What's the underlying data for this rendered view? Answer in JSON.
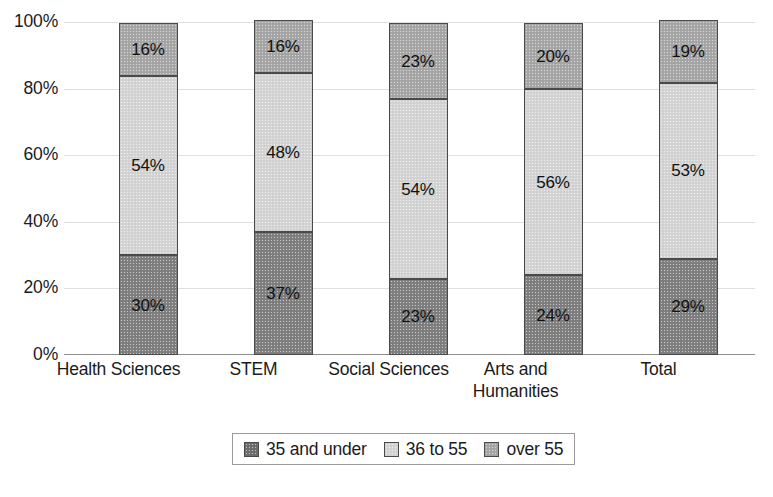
{
  "chart_data": {
    "type": "bar",
    "stacked": true,
    "normalized_percent": true,
    "title": "",
    "subtitle": "",
    "xlabel": "",
    "ylabel": "",
    "ylim": [
      0,
      100
    ],
    "ytick_labels": [
      "0%",
      "20%",
      "40%",
      "60%",
      "80%",
      "100%"
    ],
    "ytick_values": [
      0,
      20,
      40,
      60,
      80,
      100
    ],
    "grid": true,
    "legend_position": "bottom-center",
    "categories": [
      "Health Sciences",
      "STEM",
      "Social Sciences",
      "Arts and Humanities",
      "Total"
    ],
    "series": [
      {
        "name": "35 and under",
        "color": "#808080",
        "values": [
          30,
          37,
          23,
          24,
          29
        ],
        "labels": [
          "30%",
          "37%",
          "23%",
          "24%",
          "29%"
        ]
      },
      {
        "name": "36 to 55",
        "color": "#d5d5d5",
        "values": [
          54,
          48,
          54,
          56,
          53
        ],
        "labels": [
          "54%",
          "48%",
          "54%",
          "56%",
          "53%"
        ]
      },
      {
        "name": "over 55",
        "color": "#a7a7a7",
        "values": [
          16,
          16,
          23,
          20,
          19
        ],
        "labels": [
          "16%",
          "16%",
          "23%",
          "20%",
          "19%"
        ]
      }
    ]
  },
  "axis": {
    "y_labels": [
      "100%",
      "80%",
      "60%",
      "40%",
      "20%",
      "0%"
    ]
  },
  "legend": {
    "items": [
      {
        "label": "35 and under",
        "swatch": "dark-gray-swatch-icon"
      },
      {
        "label": "36 to 55",
        "swatch": "light-gray-swatch-icon"
      },
      {
        "label": "over 55",
        "swatch": "medium-gray-swatch-icon"
      }
    ]
  },
  "colors": {
    "under35": "#808080",
    "mid36to55": "#d5d5d5",
    "over55": "#a7a7a7",
    "gridline": "#dfdfdf",
    "axis": "#8d8d8d",
    "text": "#1b1b1b"
  }
}
